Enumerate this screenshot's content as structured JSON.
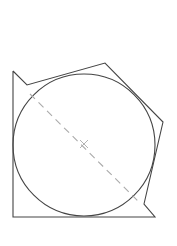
{
  "diagram": {
    "background": "#ffffff",
    "stroke_color": "#444444",
    "dash_color": "#aaaaaa",
    "circle": {
      "cx": 84,
      "cy": 145,
      "r": 71
    },
    "polygon_points": "13,71 27,85 105,63 163,122 144,204 155,217 13,217 13,71",
    "dashed_line": {
      "x1": 30,
      "y1": 94,
      "x2": 140,
      "y2": 203
    },
    "center_mark": {
      "x": 84,
      "y": 144,
      "size": 4
    }
  }
}
